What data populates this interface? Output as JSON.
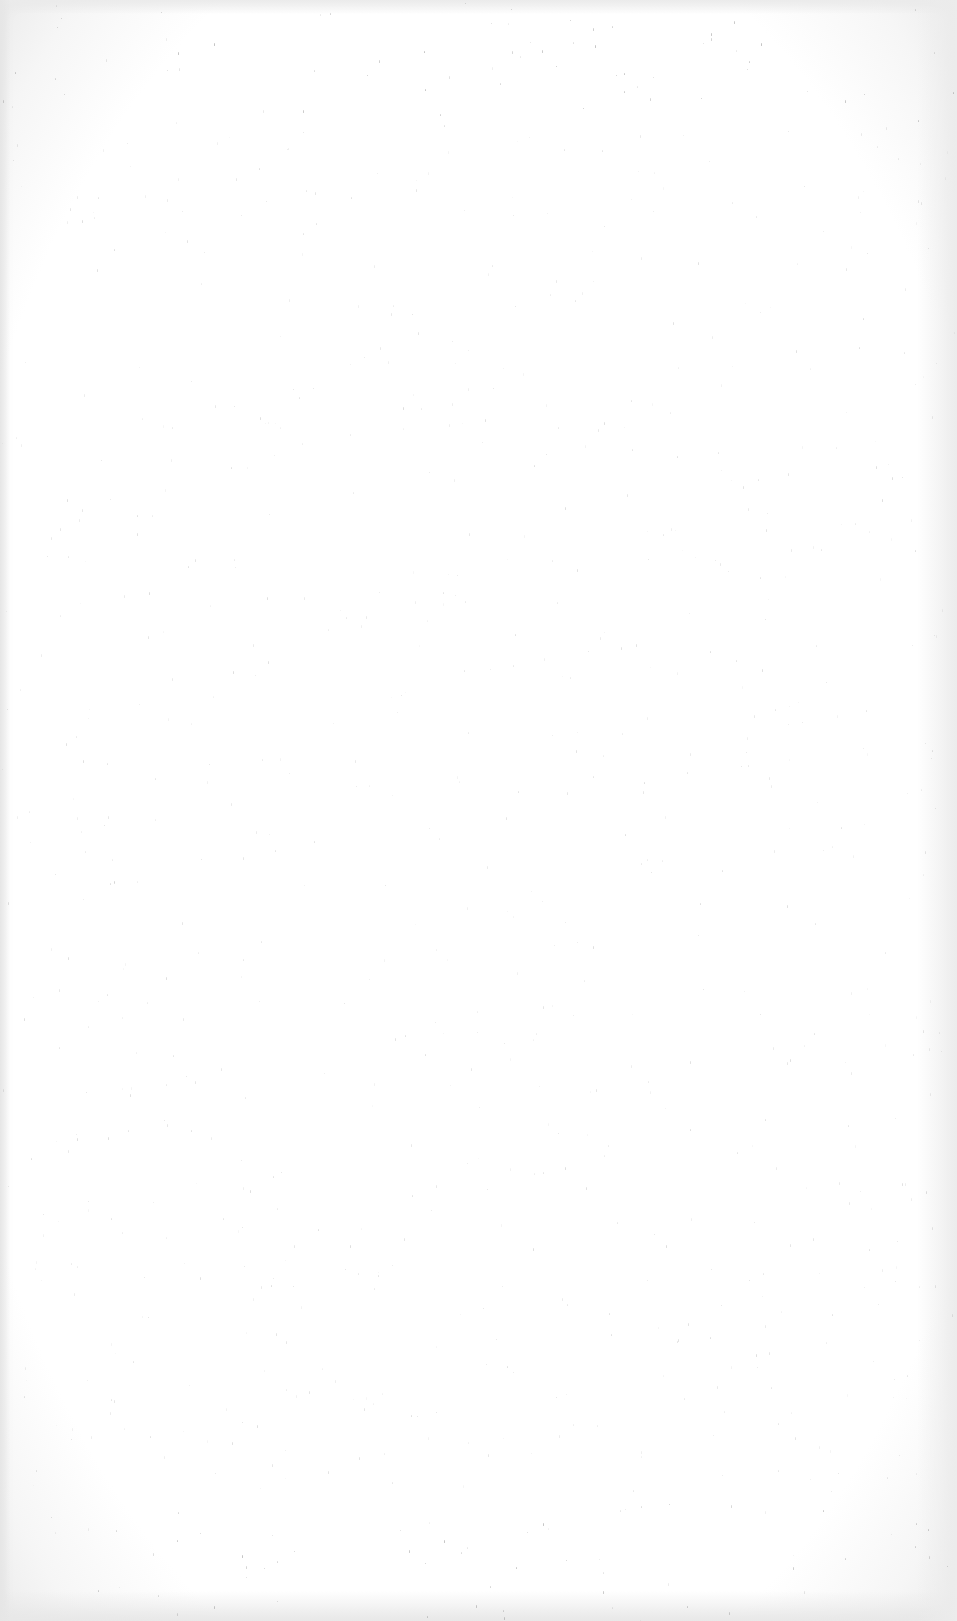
{
  "page": {
    "type": "scanned-blank-page",
    "content": "",
    "background_color": "#ffffff",
    "border_tint": "#ececec",
    "speckle_color": "#9a9a9a"
  }
}
